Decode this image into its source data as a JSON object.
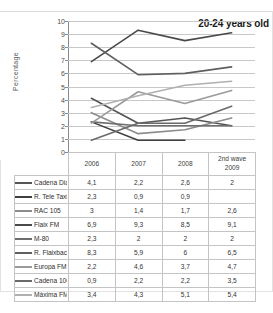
{
  "chart_data": {
    "type": "line",
    "title": "20-24 years old",
    "xlabel": "",
    "ylabel": "Percentage",
    "ylim": [
      0,
      10
    ],
    "yticks": [
      0,
      1,
      2,
      3,
      4,
      5,
      6,
      7,
      8,
      9,
      10
    ],
    "grid": true,
    "legend_position": "table-left",
    "categories": [
      "2006",
      "2007",
      "2008",
      "2nd wave 2009"
    ],
    "series": [
      {
        "name": "Cadena Dial",
        "values": [
          4.1,
          2.2,
          2.6,
          2.0
        ],
        "color": "#555555"
      },
      {
        "name": "R. Tele Taxi",
        "values": [
          2.3,
          0.9,
          0.9,
          null
        ],
        "color": "#3f3f3f"
      },
      {
        "name": "RAC 105",
        "values": [
          3.0,
          1.4,
          1.7,
          2.6
        ],
        "color": "#8c8c8c"
      },
      {
        "name": "Flaix FM",
        "values": [
          6.9,
          9.3,
          8.5,
          9.1
        ],
        "color": "#4a4a4a"
      },
      {
        "name": "M-80",
        "values": [
          2.3,
          2.0,
          2.0,
          2.0
        ],
        "color": "#6e6e6e"
      },
      {
        "name": "R. Flaixbac",
        "values": [
          8.3,
          5.9,
          6.0,
          6.5
        ],
        "color": "#5f5f5f"
      },
      {
        "name": "Europa FM",
        "values": [
          2.2,
          4.6,
          3.7,
          4.7
        ],
        "color": "#9a9a9a"
      },
      {
        "name": "Cadena 100",
        "values": [
          0.9,
          2.2,
          2.2,
          3.5
        ],
        "color": "#6a6a6a"
      },
      {
        "name": "Máxima FM",
        "values": [
          3.4,
          4.3,
          5.1,
          5.4
        ],
        "color": "#b0b0b0"
      }
    ]
  },
  "table": {
    "legend_header": "",
    "headers": [
      "2006",
      "2007",
      "2008",
      "2nd wave 2009"
    ],
    "header_2009_line1": "2nd wave",
    "header_2009_line2": "2009",
    "rows": [
      {
        "name": "Cadena Dial",
        "cells": [
          "4,1",
          "2,2",
          "2,6",
          "2"
        ]
      },
      {
        "name": "R. Tele Taxi",
        "cells": [
          "2,3",
          "0,9",
          "0,9",
          ""
        ]
      },
      {
        "name": "RAC 105",
        "cells": [
          "3",
          "1,4",
          "1,7",
          "2,6"
        ]
      },
      {
        "name": "Flaix FM",
        "cells": [
          "6,9",
          "9,3",
          "8,5",
          "9,1"
        ]
      },
      {
        "name": "M-80",
        "cells": [
          "2,3",
          "2",
          "2",
          "2"
        ]
      },
      {
        "name": "R. Flaixbac",
        "cells": [
          "8,3",
          "5,9",
          "6",
          "6,5"
        ]
      },
      {
        "name": "Europa FM",
        "cells": [
          "2,2",
          "4,6",
          "3,7",
          "4,7"
        ]
      },
      {
        "name": "Cadena 100",
        "cells": [
          "0,9",
          "2,2",
          "2,2",
          "3,5"
        ]
      },
      {
        "name": "Máxima FM",
        "cells": [
          "3,4",
          "4,3",
          "5,1",
          "5,4"
        ]
      }
    ]
  }
}
